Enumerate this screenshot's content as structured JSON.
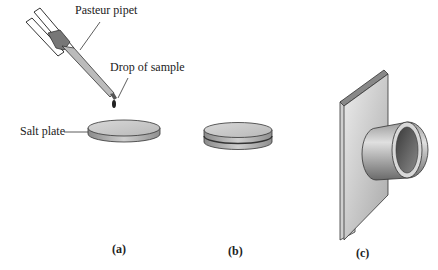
{
  "figure": {
    "labels": {
      "pipet": "Pasteur pipet",
      "drop": "Drop of sample",
      "salt_plate": "Salt plate"
    },
    "panels": [
      {
        "id": "a",
        "caption": "(a)"
      },
      {
        "id": "b",
        "caption": "(b)"
      },
      {
        "id": "c",
        "caption": "(c)"
      }
    ]
  }
}
